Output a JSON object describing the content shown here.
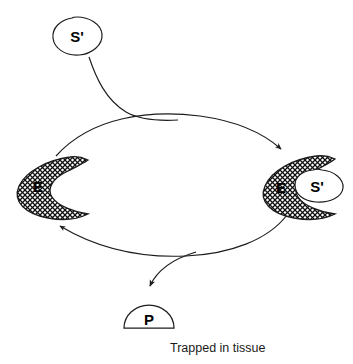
{
  "diagram": {
    "type": "cycle-diagram",
    "title_text": "",
    "caption": "Trapped in tissue",
    "colors": {
      "stroke": "#1c1c1c",
      "fill_white": "#ffffff",
      "hatch": "#111111",
      "background": "#ffffff",
      "text": "#000000"
    },
    "nodes": [
      {
        "id": "substrate-free",
        "label": "S'",
        "shape": "blob",
        "position": {
          "x": 76,
          "y": 36
        },
        "filled": false
      },
      {
        "id": "enzyme-free",
        "label": "E",
        "shape": "crescent-hatched",
        "position": {
          "x": 38,
          "y": 185
        },
        "filled": true
      },
      {
        "id": "enzyme-complex",
        "label": "E",
        "shape": "crescent-hatched",
        "position": {
          "x": 280,
          "y": 187
        },
        "filled": true
      },
      {
        "id": "substrate-bound",
        "label": "S'",
        "shape": "blob",
        "position": {
          "x": 316,
          "y": 186
        },
        "filled": false
      },
      {
        "id": "product",
        "label": "P",
        "shape": "dome",
        "position": {
          "x": 148,
          "y": 318
        },
        "filled": false
      }
    ],
    "edges": [
      {
        "id": "substrate-binding-arrow",
        "from": "substrate-free",
        "to": "enzyme-complex",
        "style": "curved",
        "arrowhead": true
      },
      {
        "id": "forward-arc",
        "from": "enzyme-free",
        "to": "enzyme-complex",
        "style": "arc-top",
        "arrowhead": true
      },
      {
        "id": "return-arc",
        "from": "enzyme-complex",
        "to": "enzyme-free",
        "style": "arc-bottom",
        "arrowhead": true
      },
      {
        "id": "product-release-arrow",
        "from": "return-arc",
        "to": "product",
        "style": "curved-branch",
        "arrowhead": true
      }
    ]
  }
}
